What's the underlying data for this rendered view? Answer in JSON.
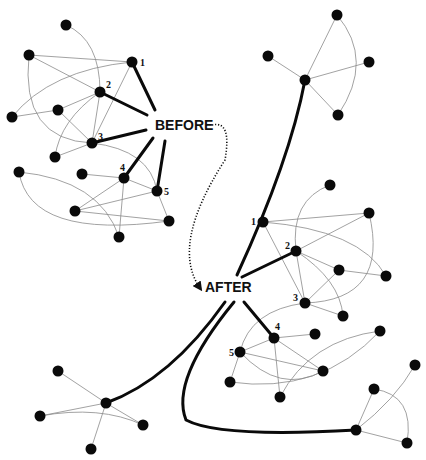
{
  "labels": {
    "before": "BEFORE",
    "after": "AFTER"
  },
  "colors": {
    "node": "#0a0a0a",
    "thin_edge": "#8a8a8a",
    "thick_edge": "#0a0a0a",
    "background": "#ffffff"
  },
  "before_cluster": {
    "nodes": [
      {
        "id": "a",
        "x": 66,
        "y": 25
      },
      {
        "id": "b",
        "x": 29,
        "y": 55
      },
      {
        "id": "1",
        "x": 132,
        "y": 62,
        "label": "1"
      },
      {
        "id": "2",
        "x": 100,
        "y": 92,
        "label": "2"
      },
      {
        "id": "c",
        "x": 12,
        "y": 117
      },
      {
        "id": "d",
        "x": 58,
        "y": 110
      },
      {
        "id": "3",
        "x": 92,
        "y": 143,
        "label": "3"
      },
      {
        "id": "e",
        "x": 55,
        "y": 157
      },
      {
        "id": "f",
        "x": 19,
        "y": 172
      },
      {
        "id": "g",
        "x": 82,
        "y": 174
      },
      {
        "id": "4",
        "x": 124,
        "y": 178,
        "label": "4"
      },
      {
        "id": "5",
        "x": 157,
        "y": 191,
        "label": "5"
      },
      {
        "id": "h",
        "x": 75,
        "y": 211
      },
      {
        "id": "i",
        "x": 169,
        "y": 221
      },
      {
        "id": "j",
        "x": 119,
        "y": 237
      }
    ]
  },
  "after_cluster_upper": {
    "nodes": [
      {
        "id": "t",
        "x": 330,
        "y": 185
      },
      {
        "id": "1",
        "x": 263,
        "y": 222,
        "label": "1"
      },
      {
        "id": "tr",
        "x": 369,
        "y": 213
      },
      {
        "id": "2",
        "x": 296,
        "y": 251,
        "label": "2"
      },
      {
        "id": "k",
        "x": 339,
        "y": 270
      },
      {
        "id": "l",
        "x": 386,
        "y": 276
      },
      {
        "id": "3",
        "x": 305,
        "y": 303,
        "label": "3"
      },
      {
        "id": "m",
        "x": 343,
        "y": 316
      }
    ]
  },
  "after_cluster_lower": {
    "nodes": [
      {
        "id": "4",
        "x": 274,
        "y": 338,
        "label": "4"
      },
      {
        "id": "o",
        "x": 315,
        "y": 334
      },
      {
        "id": "p",
        "x": 380,
        "y": 331
      },
      {
        "id": "5",
        "x": 240,
        "y": 352,
        "label": "5"
      },
      {
        "id": "q",
        "x": 323,
        "y": 371
      },
      {
        "id": "s",
        "x": 230,
        "y": 382
      },
      {
        "id": "t2",
        "x": 280,
        "y": 397
      }
    ]
  },
  "satellite_top_right": {
    "nodes": [
      {
        "id": "top",
        "x": 337,
        "y": 15
      },
      {
        "id": "left",
        "x": 268,
        "y": 56
      },
      {
        "id": "hub",
        "x": 305,
        "y": 80
      },
      {
        "id": "right",
        "x": 369,
        "y": 62
      },
      {
        "id": "bottom",
        "x": 338,
        "y": 115
      }
    ]
  },
  "satellite_bottom_left": {
    "nodes": [
      {
        "id": "hub",
        "x": 106,
        "y": 403
      },
      {
        "id": "x",
        "x": 58,
        "y": 371
      },
      {
        "id": "y",
        "x": 40,
        "y": 416
      },
      {
        "id": "z",
        "x": 143,
        "y": 425
      },
      {
        "id": "aa",
        "x": 91,
        "y": 449
      }
    ]
  },
  "satellite_bottom_right": {
    "nodes": [
      {
        "id": "hub",
        "x": 356,
        "y": 430
      },
      {
        "id": "u",
        "x": 374,
        "y": 389
      },
      {
        "id": "v",
        "x": 415,
        "y": 365
      },
      {
        "id": "w",
        "x": 407,
        "y": 443
      }
    ]
  },
  "thin_edges": [
    "M66,25 Q100,40 100,92",
    "M29,55 L132,62",
    "M29,55 L100,92",
    "M29,55 Q20,140 92,143",
    "M12,117 Q50,70 132,62",
    "M12,117 L58,110",
    "M58,110 L100,92",
    "M58,110 L92,143",
    "M132,62 L92,143",
    "M100,92 L92,143",
    "M100,92 Q60,120 55,157",
    "M55,157 L92,143",
    "M92,143 Q150,150 157,191",
    "M82,174 L124,178",
    "M124,178 L157,191",
    "M124,178 L75,211",
    "M124,178 L119,237",
    "M157,191 L75,211",
    "M157,191 L169,221",
    "M19,172 Q30,240 169,221",
    "M19,172 Q100,180 119,237",
    "M75,211 L169,221",
    "M330,185 Q290,200 296,251",
    "M263,222 L369,213",
    "M263,222 Q360,230 386,276",
    "M263,222 L305,303",
    "M296,251 L369,213",
    "M296,251 L339,270",
    "M296,251 L305,303",
    "M296,251 Q340,280 343,316",
    "M339,270 L386,276",
    "M339,270 L305,303",
    "M369,213 Q390,300 305,303",
    "M305,303 L343,316",
    "M305,303 Q250,310 240,352",
    "M274,338 L315,334",
    "M274,338 L240,352",
    "M274,338 L323,371",
    "M274,338 L280,397",
    "M240,352 L323,371",
    "M240,352 L230,382",
    "M240,352 Q280,395 323,371",
    "M230,382 Q320,395 380,331",
    "M380,331 Q310,340 280,397",
    "M305,80 L337,15",
    "M337,15 Q375,60 338,115",
    "M305,80 L268,56",
    "M305,80 L369,62",
    "M305,80 L338,115",
    "M106,403 L58,371",
    "M106,403 L40,416",
    "M106,403 L143,425",
    "M106,403 L91,449",
    "M40,416 Q100,405 143,425",
    "M356,430 L374,389",
    "M356,430 L407,443",
    "M356,430 Q395,400 415,365",
    "M374,389 Q415,395 407,443"
  ],
  "thick_edges": [
    "M132,62 L155,110",
    "M100,92 L147,115",
    "M92,143 L146,130",
    "M124,178 L153,138",
    "M157,191 L165,141",
    "M237,275 Q290,160 305,80",
    "M242,277 L296,251",
    "M244,302 L274,338",
    "M225,302 Q170,380 106,403",
    "M234,302 Q170,380 186,420 Q220,438 356,430"
  ],
  "dotted_arrow": "M212,125 Q232,120 225,160 Q170,245 200,288"
}
